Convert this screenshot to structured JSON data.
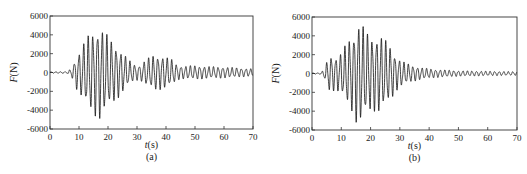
{
  "chart_data": [
    {
      "type": "line",
      "panel_label": "(a)",
      "xlabel": "t(s)",
      "ylabel": "F(N)",
      "xlim": [
        0,
        70
      ],
      "ylim": [
        -6000,
        6000
      ],
      "xticks": [
        0,
        10,
        20,
        30,
        40,
        50,
        60,
        70
      ],
      "yticks": [
        -6000,
        -4000,
        -2000,
        0,
        2000,
        4000,
        6000
      ],
      "grid": false,
      "description": "Oscillating force time history; quiet until ~7 s, main burst peaking near 17 s (~+5100 / -5200 N), decaying, second burst around 33-42 s (~+/-1900 N), then steady small oscillation (~+/-700 N) to 70 s",
      "envelope": {
        "t": [
          0,
          6,
          7.5,
          9,
          11,
          13,
          15,
          17,
          19,
          21,
          23,
          25,
          27,
          29,
          31,
          33,
          36,
          39,
          42,
          44,
          46,
          50,
          55,
          60,
          65,
          70
        ],
        "amp": [
          60,
          100,
          500,
          1700,
          2800,
          3900,
          4500,
          5100,
          4300,
          3500,
          2900,
          2200,
          1400,
          900,
          800,
          1400,
          1900,
          1800,
          1400,
          800,
          700,
          750,
          650,
          600,
          500,
          400
        ]
      },
      "period_s": 1.6
    },
    {
      "type": "line",
      "panel_label": "(b)",
      "xlabel": "t(s)",
      "ylabel": "F(N)",
      "xlim": [
        0,
        70
      ],
      "ylim": [
        -6000,
        6000
      ],
      "xticks": [
        0,
        10,
        20,
        30,
        40,
        50,
        60,
        70
      ],
      "yticks": [
        -6000,
        -4000,
        -2000,
        0,
        2000,
        4000,
        6000
      ],
      "grid": false,
      "description": "Oscillating force time history; starts ~3 s, growing burst peaking 15-18 s (~+5300 / -5700 N), decaying after ~28 s, small residual oscillation (~+/-200 N) to 70 s",
      "envelope": {
        "t": [
          0,
          3,
          4,
          6,
          8,
          10,
          12,
          14,
          15.5,
          17,
          19,
          21,
          23,
          25,
          27,
          29,
          31,
          34,
          38,
          42,
          50,
          60,
          70
        ],
        "amp": [
          40,
          80,
          400,
          2000,
          1800,
          2200,
          3400,
          4300,
          5600,
          5300,
          4300,
          4000,
          4200,
          3600,
          2800,
          1800,
          1300,
          900,
          600,
          450,
          300,
          250,
          200
        ]
      },
      "period_s": 1.55
    }
  ],
  "panels": [
    {
      "label": "(a)",
      "xlabel_italic": "t",
      "xlabel_unit": "(s)",
      "ylabel_italic": "F",
      "ylabel_unit": "(N)"
    },
    {
      "label": "(b)",
      "xlabel_italic": "t",
      "xlabel_unit": "(s)",
      "ylabel_italic": "F",
      "ylabel_unit": "(N)"
    }
  ]
}
